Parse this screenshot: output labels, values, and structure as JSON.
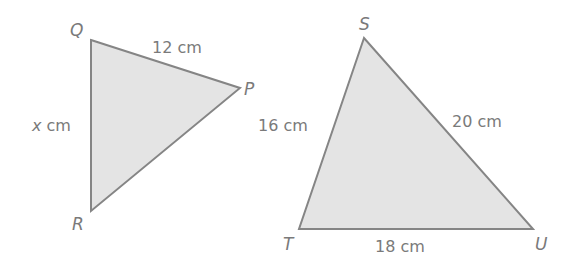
{
  "diagram": {
    "type": "similar-triangles",
    "colors": {
      "fill": "#e4e4e4",
      "stroke": "#858585",
      "text": "#7a7a7a"
    },
    "triangle_pqr": {
      "vertices": {
        "Q": "Q",
        "P": "P",
        "R": "R"
      },
      "sides": {
        "QP": "12 cm",
        "QR_var": "x",
        "QR_unit": " cm"
      }
    },
    "triangle_stu": {
      "vertices": {
        "S": "S",
        "T": "T",
        "U": "U"
      },
      "sides": {
        "ST": "16 cm",
        "SU": "20 cm",
        "TU": "18 cm"
      }
    }
  }
}
